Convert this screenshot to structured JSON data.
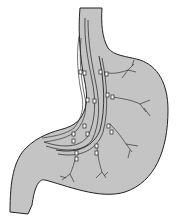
{
  "figure": {
    "colors": {
      "background": "#ffffff",
      "organ_fill": "#c4c4c4",
      "outline": "#222222",
      "nerve": "#333333",
      "clip_fill": "#ffffff"
    },
    "labels": []
  }
}
